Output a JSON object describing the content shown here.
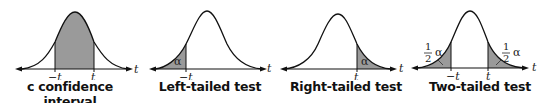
{
  "panels": [
    {
      "id": "confidence",
      "caption": "c confidence interval",
      "left_label": "−t",
      "right_label": "t",
      "axis_label": "t",
      "shading": "center"
    },
    {
      "id": "left",
      "caption": "Left-tailed test",
      "left_label": "−t",
      "axis_label": "t",
      "area_label": "α",
      "shading": "left-tail"
    },
    {
      "id": "right",
      "caption": "Right-tailed test",
      "right_label": "t",
      "axis_label": "t",
      "area_label": "α",
      "shading": "right-tail"
    },
    {
      "id": "two",
      "caption": "Two-tailed test",
      "left_label": "−t",
      "right_label": "t",
      "axis_label": "t",
      "area_label": "α",
      "frac_num": "1",
      "frac_den": "2",
      "shading": "both-tails"
    }
  ],
  "colors": {
    "shade": "#9a9a9a",
    "curve": "#111111"
  }
}
